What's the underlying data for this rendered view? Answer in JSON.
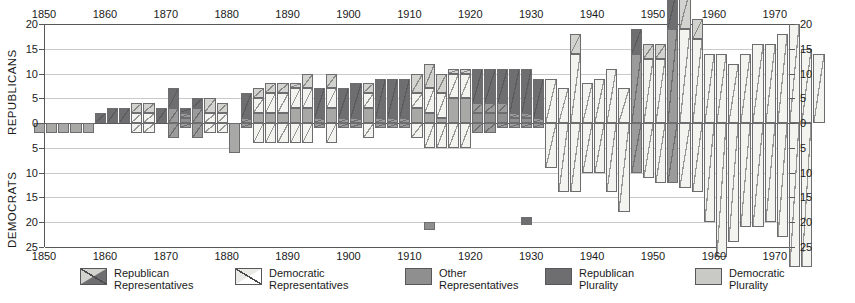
{
  "axes": {
    "left_title": "REPUBLICANS",
    "left_title_lower": "DEMOCRATS",
    "y_ticks_upper": [
      "20",
      "15",
      "10",
      "5",
      "0"
    ],
    "y_ticks_lower": [
      "5",
      "10",
      "15",
      "20",
      "25"
    ],
    "x_ticks": [
      "1850",
      "1860",
      "1870",
      "1880",
      "1890",
      "1900",
      "1910",
      "1920",
      "1930",
      "1940",
      "1950",
      "1960",
      "1970"
    ],
    "x_ticks_bottom": [
      "1850",
      "1860",
      "1870",
      "1880",
      "1890",
      "1900",
      "1910",
      "1920",
      "1930",
      "1940",
      "1950",
      "1960",
      "1970"
    ],
    "ymax": 20,
    "ymin": -25
  },
  "legend": [
    {
      "key": "republican-representatives",
      "line1": "Republican",
      "line2": "Representatives",
      "color": "#6e6e70",
      "hatch": true
    },
    {
      "key": "democratic-representatives",
      "line1": "Democratic",
      "line2": "Representatives",
      "color": "#f3f3ef",
      "hatch": true
    },
    {
      "key": "other-representatives",
      "line1": "Other",
      "line2": "Representatives",
      "color": "#8f8f90",
      "hatch": false
    },
    {
      "key": "republican-plurality",
      "line1": "Republican",
      "line2": "Plurality",
      "color": "#6e6e70",
      "hatch": false
    },
    {
      "key": "democratic-plurality",
      "line1": "Democratic",
      "line2": "Plurality",
      "color": "#c9c9c6",
      "hatch": false
    }
  ],
  "colors": {
    "republican_plurality": "#6e6e70",
    "democratic_plurality": "#d2d2ce",
    "other": "#9b9b9b",
    "grid": "#c9c9c9",
    "axis": "#58585a"
  },
  "chart_data": {
    "type": "bar",
    "title": "",
    "xlabel": "",
    "ylabel": "REPUBLICANS / DEMOCRATS",
    "ylim": [
      -25,
      20
    ],
    "grid": true,
    "legend_position": "bottom",
    "note": "Stacked diverging bars, one per 2-year Congress. rep = Republican Representatives (plotted up), dem = Democratic Representatives (plotted down), oth = Other Representatives. 'plurality' gives the controlling party shading of that Congress.",
    "series": [
      {
        "name": "Republican Representatives",
        "key": "rep"
      },
      {
        "name": "Democratic Representatives",
        "key": "dem"
      },
      {
        "name": "Other Representatives",
        "key": "oth"
      }
    ],
    "points": [
      {
        "year": 1849,
        "rep": 0,
        "dem": 0,
        "oth": 2,
        "oth_dir": "down",
        "plurality": "D"
      },
      {
        "year": 1851,
        "rep": 0,
        "dem": 0,
        "oth": 2,
        "oth_dir": "down",
        "plurality": "D"
      },
      {
        "year": 1853,
        "rep": 0,
        "dem": 0,
        "oth": 2,
        "oth_dir": "down",
        "plurality": "D"
      },
      {
        "year": 1855,
        "rep": 0,
        "dem": 0,
        "oth": 2,
        "oth_dir": "down",
        "plurality": "D"
      },
      {
        "year": 1857,
        "rep": 0,
        "dem": 0,
        "oth": 2,
        "oth_dir": "down",
        "plurality": "D"
      },
      {
        "year": 1859,
        "rep": 2,
        "dem": 0,
        "oth": 0,
        "oth_dir": "up",
        "plurality": "R"
      },
      {
        "year": 1861,
        "rep": 3,
        "dem": 0,
        "oth": 0,
        "oth_dir": "up",
        "plurality": "R"
      },
      {
        "year": 1863,
        "rep": 3,
        "dem": 0,
        "oth": 0,
        "oth_dir": "up",
        "plurality": "R"
      },
      {
        "year": 1865,
        "rep": 2,
        "dem": 2,
        "oth": 0,
        "oth_dir": "up",
        "plurality": "D"
      },
      {
        "year": 1867,
        "rep": 2,
        "dem": 2,
        "oth": 0,
        "oth_dir": "up",
        "plurality": "D"
      },
      {
        "year": 1869,
        "rep": 3,
        "dem": 0,
        "oth": 0,
        "oth_dir": "up",
        "plurality": "R"
      },
      {
        "year": 1871,
        "rep": 4,
        "dem": 3,
        "oth": 0,
        "oth_dir": "up",
        "plurality": "R"
      },
      {
        "year": 1873,
        "rep": 1,
        "dem": 1,
        "oth": 1,
        "oth_dir": "up",
        "plurality": "R"
      },
      {
        "year": 1875,
        "rep": 2,
        "dem": 3,
        "oth": 0,
        "oth_dir": "up",
        "plurality": "R"
      },
      {
        "year": 1877,
        "rep": 3,
        "dem": 2,
        "oth": 0,
        "oth_dir": "up",
        "plurality": "D"
      },
      {
        "year": 1879,
        "rep": 2,
        "dem": 2,
        "oth": 0,
        "oth_dir": "up",
        "plurality": "D"
      },
      {
        "year": 1881,
        "rep": 0,
        "dem": 0,
        "oth": 6,
        "oth_dir": "down",
        "plurality": "D"
      },
      {
        "year": 1883,
        "rep": 5,
        "dem": 1,
        "oth": 0,
        "oth_dir": "up",
        "plurality": "R"
      },
      {
        "year": 1885,
        "rep": 2,
        "dem": 3,
        "oth": 2,
        "oth_dir": "up",
        "plurality": "D"
      },
      {
        "year": 1887,
        "rep": 2,
        "dem": 4,
        "oth": 2,
        "oth_dir": "up",
        "plurality": "D"
      },
      {
        "year": 1889,
        "rep": 2,
        "dem": 4,
        "oth": 2,
        "oth_dir": "up",
        "plurality": "D"
      },
      {
        "year": 1891,
        "rep": 1,
        "dem": 4,
        "oth": 3,
        "oth_dir": "up",
        "plurality": "D"
      },
      {
        "year": 1893,
        "rep": 3,
        "dem": 4,
        "oth": 3,
        "oth_dir": "up",
        "plurality": "D"
      },
      {
        "year": 1895,
        "rep": 6,
        "dem": 1,
        "oth": 0,
        "oth_dir": "up",
        "plurality": "R"
      },
      {
        "year": 1897,
        "rep": 3,
        "dem": 4,
        "oth": 3,
        "oth_dir": "up",
        "plurality": "D"
      },
      {
        "year": 1899,
        "rep": 6,
        "dem": 1,
        "oth": 0,
        "oth_dir": "up",
        "plurality": "R"
      },
      {
        "year": 1901,
        "rep": 7,
        "dem": 1,
        "oth": 0,
        "oth_dir": "up",
        "plurality": "R"
      },
      {
        "year": 1903,
        "rep": 2,
        "dem": 3,
        "oth": 3,
        "oth_dir": "up",
        "plurality": "D"
      },
      {
        "year": 1905,
        "rep": 8,
        "dem": 1,
        "oth": 0,
        "oth_dir": "up",
        "plurality": "R"
      },
      {
        "year": 1907,
        "rep": 8,
        "dem": 1,
        "oth": 0,
        "oth_dir": "up",
        "plurality": "R"
      },
      {
        "year": 1909,
        "rep": 8,
        "dem": 1,
        "oth": 0,
        "oth_dir": "up",
        "plurality": "R"
      },
      {
        "year": 1911,
        "rep": 4,
        "dem": 3,
        "oth": 3,
        "oth_dir": "up",
        "plurality": "D"
      },
      {
        "year": 1913,
        "rep": 5,
        "dem": 5,
        "oth": 2,
        "oth_dir": "up",
        "plurality": "D"
      },
      {
        "year": 1915,
        "rep": 4,
        "dem": 5,
        "oth": 1,
        "oth_dir": "up",
        "plurality": "D"
      },
      {
        "year": 1917,
        "rep": 1,
        "dem": 5,
        "oth": 5,
        "oth_dir": "up",
        "plurality": "D"
      },
      {
        "year": 1919,
        "rep": 1,
        "dem": 5,
        "oth": 5,
        "oth_dir": "up",
        "plurality": "D"
      },
      {
        "year": 1921,
        "rep": 7,
        "dem": 2,
        "oth": 2,
        "oth_dir": "up",
        "plurality": "R"
      },
      {
        "year": 1923,
        "rep": 7,
        "dem": 2,
        "oth": 2,
        "oth_dir": "up",
        "plurality": "R"
      },
      {
        "year": 1925,
        "rep": 7,
        "dem": 2,
        "oth": 2,
        "oth_dir": "up",
        "plurality": "R"
      },
      {
        "year": 1927,
        "rep": 9,
        "dem": 1,
        "oth": 1,
        "oth_dir": "up",
        "plurality": "R"
      },
      {
        "year": 1929,
        "rep": 9,
        "dem": 1,
        "oth": 1,
        "oth_dir": "up",
        "plurality": "R"
      },
      {
        "year": 1931,
        "rep": 8,
        "dem": 1,
        "oth": 20,
        "oth_dir": "mark",
        "plurality": "R"
      },
      {
        "year": 1933,
        "rep": 0,
        "dem": 9,
        "oth": 0,
        "oth_dir": "up",
        "plurality": "D"
      },
      {
        "year": 1935,
        "rep": 0,
        "dem": 7,
        "oth": 0,
        "oth_dir": "up",
        "plurality": "D"
      },
      {
        "year": 1937,
        "rep": 4,
        "dem": 14,
        "oth": 0,
        "oth_dir": "up",
        "plurality": "D"
      },
      {
        "year": 1939,
        "rep": 0,
        "dem": 8,
        "oth": 0,
        "oth_dir": "up",
        "plurality": "D"
      },
      {
        "year": 1941,
        "rep": 0,
        "dem": 9,
        "oth": 0,
        "oth_dir": "up",
        "plurality": "D"
      },
      {
        "year": 1943,
        "rep": 0,
        "dem": 11,
        "oth": 0,
        "oth_dir": "up",
        "plurality": "D"
      },
      {
        "year": 1945,
        "rep": 0,
        "dem": 7,
        "oth": 0,
        "oth_dir": "up",
        "plurality": "D"
      },
      {
        "year": 1947,
        "rep": 5,
        "dem": 14,
        "oth": 0,
        "oth_dir": "up",
        "plurality": "R"
      },
      {
        "year": 1949,
        "rep": 3,
        "dem": 13,
        "oth": 0,
        "oth_dir": "up",
        "plurality": "D"
      },
      {
        "year": 1951,
        "rep": 3,
        "dem": 13,
        "oth": 0,
        "oth_dir": "up",
        "plurality": "D"
      },
      {
        "year": 1953,
        "rep": 8,
        "dem": 19,
        "oth": 0,
        "oth_dir": "up",
        "plurality": "R"
      },
      {
        "year": 1955,
        "rep": 8,
        "dem": 19,
        "oth": 0,
        "oth_dir": "up",
        "plurality": "D"
      },
      {
        "year": 1957,
        "rep": 4,
        "dem": 17,
        "oth": 0,
        "oth_dir": "up",
        "plurality": "D"
      },
      {
        "year": 1959,
        "rep": 0,
        "dem": 14,
        "oth": 0,
        "oth_dir": "up",
        "plurality": "D"
      },
      {
        "year": 1961,
        "rep": 0,
        "dem": 14,
        "oth": 0,
        "oth_dir": "up",
        "plurality": "D"
      },
      {
        "year": 1963,
        "rep": 0,
        "dem": 12,
        "oth": 0,
        "oth_dir": "up",
        "plurality": "D"
      },
      {
        "year": 1965,
        "rep": 0,
        "dem": 14,
        "oth": 0,
        "oth_dir": "up",
        "plurality": "D"
      },
      {
        "year": 1967,
        "rep": 0,
        "dem": 16,
        "oth": 0,
        "oth_dir": "up",
        "plurality": "D"
      },
      {
        "year": 1969,
        "rep": 0,
        "dem": 16,
        "oth": 0,
        "oth_dir": "up",
        "plurality": "D"
      },
      {
        "year": 1971,
        "rep": 0,
        "dem": 18,
        "oth": 0,
        "oth_dir": "up",
        "plurality": "D"
      },
      {
        "year": 1973,
        "rep": 0,
        "dem": 20,
        "oth": 0,
        "oth_dir": "up",
        "plurality": "D"
      },
      {
        "year": 1975,
        "rep": 0,
        "dem": 15,
        "oth": 0,
        "oth_dir": "up",
        "plurality": "D"
      },
      {
        "year": 1977,
        "rep": 0,
        "dem": 14,
        "oth": 0,
        "oth_dir": "up",
        "plurality": "D"
      }
    ],
    "below_axis": [
      {
        "year": 1849,
        "dem": 2,
        "rep": 0,
        "plurality": "D"
      },
      {
        "year": 1851,
        "dem": 2,
        "rep": 0,
        "plurality": "D"
      },
      {
        "year": 1853,
        "dem": 2,
        "rep": 0,
        "plurality": "D"
      },
      {
        "year": 1855,
        "dem": 2,
        "rep": 0,
        "plurality": "D"
      },
      {
        "year": 1857,
        "dem": 2,
        "rep": 0,
        "plurality": "D"
      },
      {
        "year": 1859,
        "dem": 0,
        "rep": 0,
        "plurality": "R"
      },
      {
        "year": 1861,
        "dem": 0,
        "rep": 0,
        "plurality": "R"
      },
      {
        "year": 1863,
        "dem": 0,
        "rep": 0,
        "plurality": "R"
      },
      {
        "year": 1865,
        "dem": 2,
        "rep": 0,
        "plurality": "D"
      },
      {
        "year": 1867,
        "dem": 2,
        "rep": 0,
        "plurality": "D"
      },
      {
        "year": 1869,
        "dem": 0,
        "rep": 0,
        "plurality": "R"
      },
      {
        "year": 1871,
        "dem": 3,
        "rep": 0,
        "plurality": "R"
      },
      {
        "year": 1873,
        "dem": 1,
        "rep": 0,
        "plurality": "R"
      },
      {
        "year": 1875,
        "dem": 3,
        "rep": 0,
        "plurality": "D"
      },
      {
        "year": 1877,
        "dem": 2,
        "rep": 0,
        "plurality": "D"
      },
      {
        "year": 1879,
        "dem": 2,
        "rep": 0,
        "plurality": "D"
      },
      {
        "year": 1881,
        "dem": 6,
        "rep": 0,
        "plurality": "D"
      },
      {
        "year": 1883,
        "dem": 1,
        "rep": 0,
        "plurality": "R"
      },
      {
        "year": 1885,
        "dem": 4,
        "rep": 0,
        "plurality": "D"
      },
      {
        "year": 1887,
        "dem": 4,
        "rep": 0,
        "plurality": "D"
      },
      {
        "year": 1889,
        "dem": 4,
        "rep": 0,
        "plurality": "D"
      },
      {
        "year": 1891,
        "dem": 4,
        "rep": 0,
        "plurality": "D"
      },
      {
        "year": 1893,
        "dem": 4,
        "rep": 0,
        "plurality": "D"
      },
      {
        "year": 1895,
        "dem": 1,
        "rep": 0,
        "plurality": "R"
      },
      {
        "year": 1897,
        "dem": 4,
        "rep": 0,
        "plurality": "D"
      },
      {
        "year": 1899,
        "dem": 1,
        "rep": 0,
        "plurality": "R"
      },
      {
        "year": 1901,
        "dem": 1,
        "rep": 0,
        "plurality": "R"
      },
      {
        "year": 1903,
        "dem": 3,
        "rep": 0,
        "plurality": "D"
      },
      {
        "year": 1905,
        "dem": 1,
        "rep": 0,
        "plurality": "R"
      },
      {
        "year": 1907,
        "dem": 1,
        "rep": 0,
        "plurality": "R"
      },
      {
        "year": 1909,
        "dem": 1,
        "rep": 0,
        "plurality": "R"
      },
      {
        "year": 1911,
        "dem": 3,
        "rep": 0,
        "plurality": "D"
      },
      {
        "year": 1913,
        "dem": 5,
        "rep": 21,
        "plurality": "D"
      },
      {
        "year": 1915,
        "dem": 5,
        "rep": 0,
        "plurality": "D"
      },
      {
        "year": 1917,
        "dem": 5,
        "rep": 0,
        "plurality": "D"
      },
      {
        "year": 1919,
        "dem": 5,
        "rep": 0,
        "plurality": "D"
      },
      {
        "year": 1921,
        "dem": 2,
        "rep": 0,
        "plurality": "R"
      },
      {
        "year": 1923,
        "dem": 2,
        "rep": 0,
        "plurality": "R"
      },
      {
        "year": 1925,
        "dem": 1,
        "rep": 0,
        "plurality": "R"
      },
      {
        "year": 1927,
        "dem": 1,
        "rep": 0,
        "plurality": "R"
      },
      {
        "year": 1929,
        "dem": 1,
        "rep": 20,
        "plurality": "R"
      },
      {
        "year": 1931,
        "dem": 1,
        "rep": 0,
        "plurality": "R"
      },
      {
        "year": 1933,
        "dem": 9,
        "rep": 0,
        "plurality": "D"
      },
      {
        "year": 1935,
        "dem": 14,
        "rep": 0,
        "plurality": "D"
      },
      {
        "year": 1937,
        "dem": 14,
        "rep": 0,
        "plurality": "D"
      },
      {
        "year": 1939,
        "dem": 10,
        "rep": 0,
        "plurality": "D"
      },
      {
        "year": 1941,
        "dem": 10,
        "rep": 0,
        "plurality": "D"
      },
      {
        "year": 1943,
        "dem": 14,
        "rep": 0,
        "plurality": "D"
      },
      {
        "year": 1945,
        "dem": 18,
        "rep": 0,
        "plurality": "D"
      },
      {
        "year": 1947,
        "dem": 10,
        "rep": 0,
        "plurality": "R"
      },
      {
        "year": 1949,
        "dem": 11,
        "rep": 0,
        "plurality": "D"
      },
      {
        "year": 1951,
        "dem": 12,
        "rep": 0,
        "plurality": "D"
      },
      {
        "year": 1953,
        "dem": 12,
        "rep": 0,
        "plurality": "R"
      },
      {
        "year": 1955,
        "dem": 13,
        "rep": 0,
        "plurality": "D"
      },
      {
        "year": 1957,
        "dem": 14,
        "rep": 0,
        "plurality": "D"
      },
      {
        "year": 1959,
        "dem": 20,
        "rep": 0,
        "plurality": "D"
      },
      {
        "year": 1961,
        "dem": 27,
        "rep": 0,
        "plurality": "D"
      },
      {
        "year": 1963,
        "dem": 24,
        "rep": 0,
        "plurality": "D"
      },
      {
        "year": 1965,
        "dem": 21,
        "rep": 0,
        "plurality": "D"
      },
      {
        "year": 1967,
        "dem": 21,
        "rep": 0,
        "plurality": "D"
      },
      {
        "year": 1969,
        "dem": 20,
        "rep": 0,
        "plurality": "D"
      },
      {
        "year": 1971,
        "dem": 23,
        "rep": 0,
        "plurality": "D"
      },
      {
        "year": 1973,
        "dem": 29,
        "rep": 0,
        "plurality": "D"
      },
      {
        "year": 1975,
        "dem": 29,
        "rep": 0,
        "plurality": "D"
      }
    ]
  }
}
